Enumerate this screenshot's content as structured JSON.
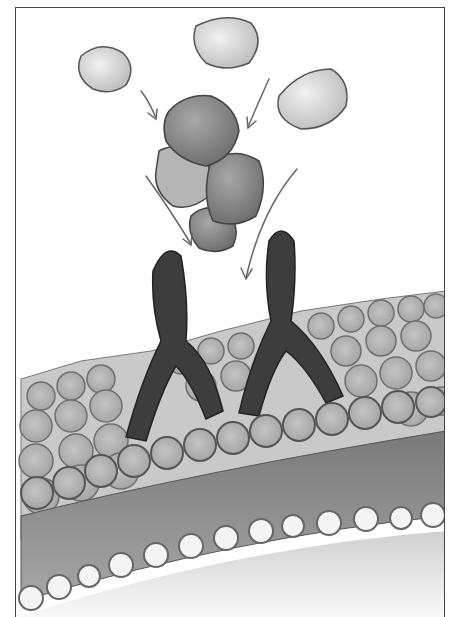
{
  "illustration": {
    "subject": "Pencil drawing of antigens binding to Y-shaped antibodies on a cell membrane surface",
    "elements": {
      "free_antigens": 3,
      "bound_antigen_cluster": 5,
      "antibodies": 2,
      "arrows": 4,
      "membrane_spheres_layer": "upper lipid layer of spheres",
      "lower_sphere_row": 16
    },
    "colors": {
      "background": "#ffffff",
      "frame": "#444444",
      "light_antigen": "#d8d8d8",
      "dark_antigen": "#8a8a8a",
      "antibody": "#3a3a3a",
      "membrane_sphere": "#b8b8b8",
      "membrane_band": "#8c8c8c",
      "lower_sphere": "#f4f4f4"
    }
  }
}
